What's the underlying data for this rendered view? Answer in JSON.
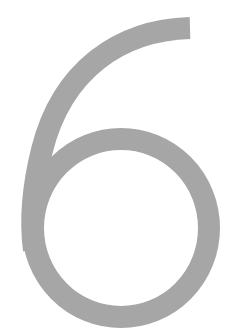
{
  "glyph": {
    "character": "6",
    "color": "#a6a6a6",
    "background": "#ffffff"
  }
}
